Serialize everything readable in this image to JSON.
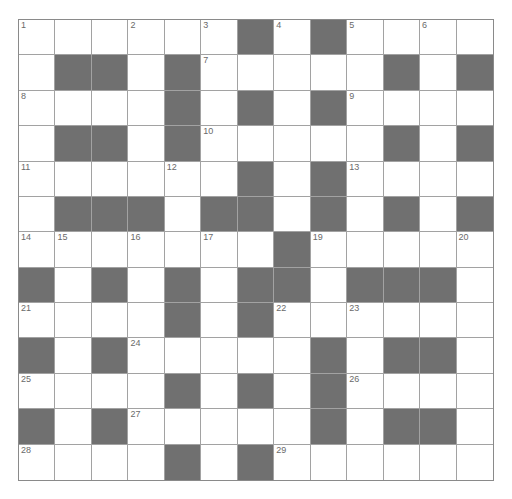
{
  "puzzle": {
    "rows": 13,
    "cols": 13,
    "colors": {
      "block": "#707070",
      "open": "#ffffff",
      "grid_line": "#a2a2a2",
      "number": "#6a6a6a"
    },
    "grid": [
      "WWWWWWBWBWWWW",
      "WBBWBWWWWWBWB",
      "WWWWBWBWBWWWW",
      "WBBWBWWWWWBWB",
      "WWWWWWBWBWWWW",
      "WBBBWBBWBWBWB",
      "WWWWWWWBWWWWW",
      "BWBWBWBBWBBBW",
      "WWWWBWBWWWWWW",
      "BWBWWWWWBWBBW",
      "WWWWBWBWBWWWW",
      "BWBWWWWWBWBBW",
      "WWWWBWBWWWWWW"
    ],
    "numbers": [
      {
        "n": "1",
        "row": 0,
        "col": 0
      },
      {
        "n": "2",
        "row": 0,
        "col": 3
      },
      {
        "n": "3",
        "row": 0,
        "col": 5
      },
      {
        "n": "4",
        "row": 0,
        "col": 7
      },
      {
        "n": "5",
        "row": 0,
        "col": 9
      },
      {
        "n": "6",
        "row": 0,
        "col": 11
      },
      {
        "n": "7",
        "row": 1,
        "col": 5
      },
      {
        "n": "8",
        "row": 2,
        "col": 0
      },
      {
        "n": "9",
        "row": 2,
        "col": 9
      },
      {
        "n": "10",
        "row": 3,
        "col": 5
      },
      {
        "n": "11",
        "row": 4,
        "col": 0
      },
      {
        "n": "12",
        "row": 4,
        "col": 4
      },
      {
        "n": "13",
        "row": 4,
        "col": 9
      },
      {
        "n": "14",
        "row": 6,
        "col": 0
      },
      {
        "n": "15",
        "row": 6,
        "col": 1
      },
      {
        "n": "16",
        "row": 6,
        "col": 3
      },
      {
        "n": "17",
        "row": 6,
        "col": 5
      },
      {
        "n": "18",
        "row": 6,
        "col": 7
      },
      {
        "n": "19",
        "row": 6,
        "col": 8
      },
      {
        "n": "20",
        "row": 6,
        "col": 12
      },
      {
        "n": "21",
        "row": 8,
        "col": 0
      },
      {
        "n": "22",
        "row": 8,
        "col": 7
      },
      {
        "n": "23",
        "row": 8,
        "col": 9
      },
      {
        "n": "24",
        "row": 9,
        "col": 3
      },
      {
        "n": "25",
        "row": 10,
        "col": 0
      },
      {
        "n": "26",
        "row": 10,
        "col": 9
      },
      {
        "n": "27",
        "row": 11,
        "col": 3
      },
      {
        "n": "28",
        "row": 12,
        "col": 0
      },
      {
        "n": "29",
        "row": 12,
        "col": 7
      }
    ]
  }
}
